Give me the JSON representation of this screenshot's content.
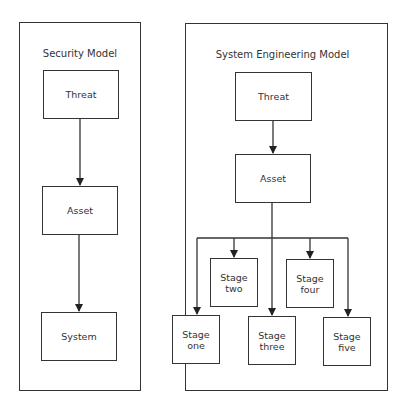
{
  "security_model": {
    "title": "Security Model",
    "nodes": [
      {
        "id": "threat",
        "line1": "Threat"
      },
      {
        "id": "asset",
        "line1": "Asset"
      },
      {
        "id": "system",
        "line1": "System"
      }
    ],
    "edges": [
      [
        "threat",
        "asset"
      ],
      [
        "asset",
        "system"
      ]
    ]
  },
  "system_engineering_model": {
    "title": "System Engineering Model",
    "nodes": [
      {
        "id": "threat",
        "line1": "Threat"
      },
      {
        "id": "asset",
        "line1": "Asset"
      },
      {
        "id": "stage_one",
        "line1": "Stage",
        "line2": "one"
      },
      {
        "id": "stage_two",
        "line1": "Stage",
        "line2": "two"
      },
      {
        "id": "stage_three",
        "line1": "Stage",
        "line2": "three"
      },
      {
        "id": "stage_four",
        "line1": "Stage",
        "line2": "four"
      },
      {
        "id": "stage_five",
        "line1": "Stage",
        "line2": "five"
      }
    ],
    "edges": [
      [
        "threat",
        "asset"
      ],
      [
        "asset",
        "stage_one"
      ],
      [
        "asset",
        "stage_two"
      ],
      [
        "asset",
        "stage_three"
      ],
      [
        "asset",
        "stage_four"
      ],
      [
        "asset",
        "stage_five"
      ]
    ]
  },
  "colors": {
    "stroke": "#333333",
    "background": "#ffffff"
  }
}
